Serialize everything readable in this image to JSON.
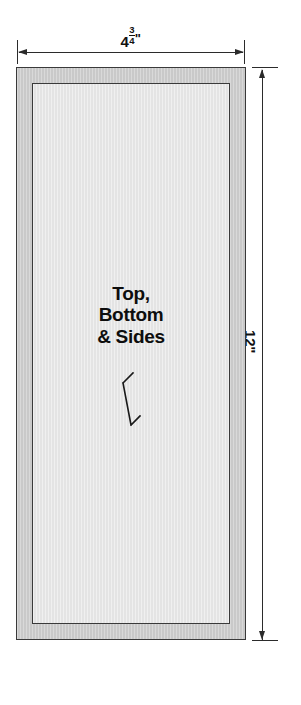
{
  "drawing": {
    "title": "Top, Bottom & Sides panel dimension drawing",
    "background_color": "#ffffff",
    "line_color": "#2b2b2b",
    "border_color": "#3a3a3a",
    "band_fill_color": "#c9c9c9",
    "inner_fill_color": "#e4e4e4",
    "text_color": "#0d0d0d"
  },
  "dimensions": {
    "width": {
      "label": "4¾\"",
      "whole": "4",
      "numerator": "3",
      "denominator": "4",
      "unit": "\"",
      "value": 4.75,
      "units": "inches",
      "orientation": "horizontal",
      "position": "top"
    },
    "height": {
      "label": "12\"",
      "value": 12,
      "units": "inches",
      "orientation": "vertical",
      "position": "right"
    }
  },
  "part": {
    "caption_lines": [
      "Top,",
      "Bottom",
      "& Sides"
    ],
    "caption_full": "Top, Bottom & Sides",
    "leader": "zigzag-thickness-arrow"
  }
}
